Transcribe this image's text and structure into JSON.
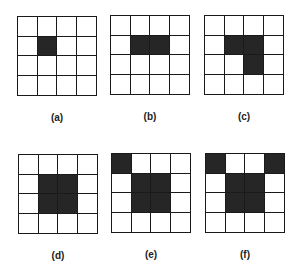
{
  "figure": {
    "fill_color": "#262626",
    "grid_size": [
      4,
      4
    ],
    "panels": [
      {
        "label": "(a)",
        "filled_cells": [
          [
            1,
            1
          ]
        ]
      },
      {
        "label": "(b)",
        "filled_cells": [
          [
            1,
            1
          ],
          [
            1,
            2
          ]
        ]
      },
      {
        "label": "(c)",
        "filled_cells": [
          [
            1,
            1
          ],
          [
            1,
            2
          ],
          [
            2,
            2
          ]
        ]
      },
      {
        "label": "(d)",
        "filled_cells": [
          [
            1,
            1
          ],
          [
            1,
            2
          ],
          [
            2,
            1
          ],
          [
            2,
            2
          ]
        ]
      },
      {
        "label": "(e)",
        "filled_cells": [
          [
            0,
            0
          ],
          [
            1,
            1
          ],
          [
            1,
            2
          ],
          [
            2,
            1
          ],
          [
            2,
            2
          ]
        ]
      },
      {
        "label": "(f)",
        "filled_cells": [
          [
            0,
            0
          ],
          [
            0,
            3
          ],
          [
            1,
            1
          ],
          [
            1,
            2
          ],
          [
            2,
            1
          ],
          [
            2,
            2
          ]
        ]
      }
    ]
  }
}
